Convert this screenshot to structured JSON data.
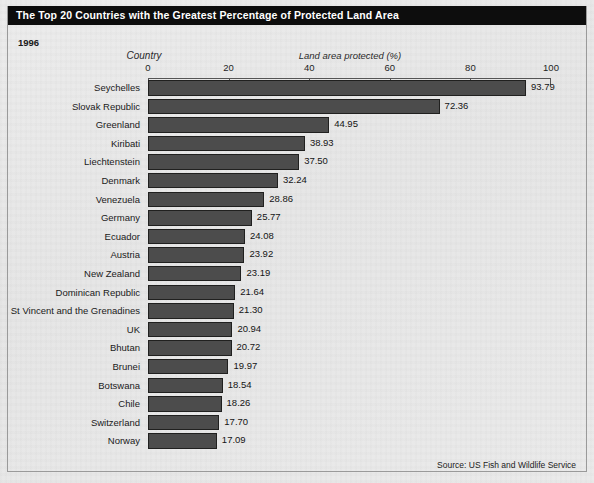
{
  "figure": {
    "title": "The Top 20 Countries with the Greatest Percentage of Protected Land Area",
    "year_label": "1996",
    "source": "Source: US Fish and Wildlife Service",
    "accent_color": "#0d0d0d",
    "bar_color": "#4c4c4c",
    "background_color": "#e9e9e9"
  },
  "chart_data": {
    "type": "bar",
    "orientation": "horizontal",
    "title": "The Top 20 Countries with the Greatest Percentage of Protected Land Area",
    "subtitle": "1996",
    "xlabel": "Land area protected (%)",
    "ylabel": "Country",
    "xlim": [
      0,
      100
    ],
    "xticks": [
      0,
      20,
      40,
      60,
      80,
      100
    ],
    "xtick_labels": [
      "0",
      "20",
      "40",
      "60",
      "80",
      "100"
    ],
    "grid": false,
    "legend": false,
    "source": "Source: US Fish and Wildlife Service",
    "categories": [
      "Seychelles",
      "Slovak Republic",
      "Greenland",
      "Kiribati",
      "Liechtenstein",
      "Denmark",
      "Venezuela",
      "Germany",
      "Ecuador",
      "Austria",
      "New Zealand",
      "Dominican Republic",
      "St Vincent and the Grenadines",
      "UK",
      "Bhutan",
      "Brunei",
      "Botswana",
      "Chile",
      "Switzerland",
      "Norway"
    ],
    "values": [
      93.79,
      72.36,
      44.95,
      38.93,
      37.5,
      32.24,
      28.86,
      25.77,
      24.08,
      23.92,
      23.19,
      21.64,
      21.3,
      20.94,
      20.72,
      19.97,
      18.54,
      18.26,
      17.7,
      17.09
    ],
    "value_labels": [
      "93.79",
      "72.36",
      "44.95",
      "38.93",
      "37.50",
      "32.24",
      "28.86",
      "25.77",
      "24.08",
      "23.92",
      "23.19",
      "21.64",
      "21.30",
      "20.94",
      "20.72",
      "19.97",
      "18.54",
      "18.26",
      "17.70",
      "17.09"
    ]
  }
}
